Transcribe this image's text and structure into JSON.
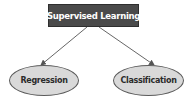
{
  "diagram": {
    "type": "tree",
    "root": {
      "label": "Supervised Learning",
      "fill": "#4a4a4a",
      "text_color": "#ffffff"
    },
    "children": [
      {
        "label": "Regression",
        "shape": "ellipse",
        "fill": "#d9d9d9"
      },
      {
        "label": "Classification",
        "shape": "ellipse",
        "fill": "#d9d9d9"
      }
    ],
    "edges": [
      {
        "from": "Supervised Learning",
        "to": "Regression",
        "style": "arrow"
      },
      {
        "from": "Supervised Learning",
        "to": "Classification",
        "style": "arrow"
      }
    ],
    "edge_color": "#555555"
  }
}
